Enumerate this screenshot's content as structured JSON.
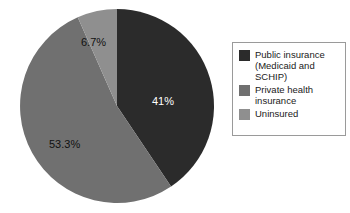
{
  "chart_data": {
    "type": "pie",
    "title": "",
    "categories": [
      "Public insurance (Medicaid and SCHIP)",
      "Private health insurance",
      "Uninsured"
    ],
    "values": [
      41,
      53.3,
      6.7
    ],
    "value_labels": [
      "41%",
      "53.3%",
      "6.7%"
    ],
    "colors": [
      "#2b2b2b",
      "#707070",
      "#8f8f8f"
    ],
    "label_colors": [
      "#ffffff",
      "#111111",
      "#111111"
    ],
    "start_angle_deg": 0,
    "direction": "clockwise",
    "legend_position": "right",
    "grid": false
  },
  "pie": {
    "center_x": 117,
    "center_y": 106,
    "radius": 97,
    "slices": [
      {
        "name": "public-insurance",
        "percent": 41,
        "label": "41%",
        "color": "#2b2b2b",
        "label_color": "#ffffff"
      },
      {
        "name": "private-health-insurance",
        "percent": 53.3,
        "label": "53.3%",
        "color": "#707070",
        "label_color": "#111111"
      },
      {
        "name": "uninsured",
        "percent": 6.7,
        "label": "6.7%",
        "color": "#8f8f8f",
        "label_color": "#111111"
      }
    ]
  },
  "legend": {
    "border_color": "#9a9a9a",
    "items": [
      {
        "swatch_color": "#2b2b2b",
        "line1": "Public insurance",
        "line2": "(Medicaid and",
        "line3": "SCHIP)"
      },
      {
        "swatch_color": "#707070",
        "line1": "Private health",
        "line2": "insurance",
        "line3": ""
      },
      {
        "swatch_color": "#8f8f8f",
        "line1": "Uninsured",
        "line2": "",
        "line3": ""
      }
    ]
  }
}
